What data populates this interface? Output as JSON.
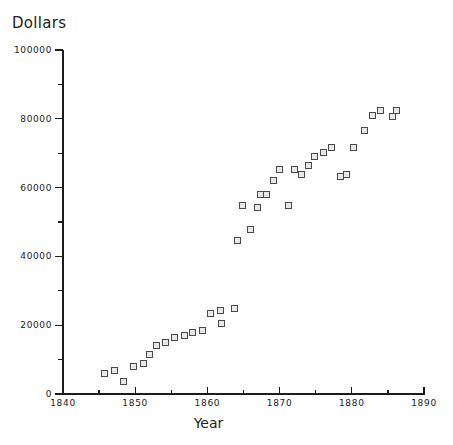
{
  "chart_data": {
    "type": "scatter",
    "title": "Dollars",
    "xlabel": "Year",
    "ylabel": "Dollars",
    "xlim": [
      1840,
      1890
    ],
    "ylim": [
      0,
      100000
    ],
    "grid": false,
    "legend": null,
    "marker": "open-square",
    "marker_color": "#4a4a4a",
    "x_major_ticks": [
      1840,
      1850,
      1860,
      1870,
      1880,
      1890
    ],
    "x_minor_ticks": [
      1845,
      1855,
      1865,
      1875,
      1885
    ],
    "y_major_ticks": [
      0,
      20000,
      40000,
      60000,
      80000,
      100000
    ],
    "y_minor_ticks": [
      10000,
      30000,
      50000,
      70000,
      90000
    ],
    "x_tick_labels": [
      "1840",
      "1850",
      "1860",
      "1870",
      "1880",
      "1890"
    ],
    "y_tick_labels": [
      "0",
      "20000",
      "40000",
      "60000",
      "80000",
      "100000"
    ],
    "points": [
      {
        "x": 1845.7,
        "y": 6100
      },
      {
        "x": 1847.2,
        "y": 6700
      },
      {
        "x": 1848.4,
        "y": 3500
      },
      {
        "x": 1849.8,
        "y": 8100
      },
      {
        "x": 1851.2,
        "y": 9000
      },
      {
        "x": 1852.0,
        "y": 11600
      },
      {
        "x": 1853.0,
        "y": 14200
      },
      {
        "x": 1854.2,
        "y": 15100
      },
      {
        "x": 1855.5,
        "y": 16300
      },
      {
        "x": 1856.8,
        "y": 16900
      },
      {
        "x": 1857.9,
        "y": 18000
      },
      {
        "x": 1859.3,
        "y": 18600
      },
      {
        "x": 1860.4,
        "y": 23500
      },
      {
        "x": 1861.8,
        "y": 24400
      },
      {
        "x": 1862.0,
        "y": 20600
      },
      {
        "x": 1863.8,
        "y": 25000
      },
      {
        "x": 1864.2,
        "y": 44700
      },
      {
        "x": 1864.9,
        "y": 54900
      },
      {
        "x": 1866.0,
        "y": 47800
      },
      {
        "x": 1866.9,
        "y": 54300
      },
      {
        "x": 1867.4,
        "y": 58100
      },
      {
        "x": 1868.2,
        "y": 57900
      },
      {
        "x": 1869.1,
        "y": 62100
      },
      {
        "x": 1870.0,
        "y": 65400
      },
      {
        "x": 1871.2,
        "y": 54900
      },
      {
        "x": 1872.0,
        "y": 65200
      },
      {
        "x": 1873.1,
        "y": 63700
      },
      {
        "x": 1874.0,
        "y": 66300
      },
      {
        "x": 1874.9,
        "y": 68900
      },
      {
        "x": 1876.1,
        "y": 70300
      },
      {
        "x": 1877.2,
        "y": 71800
      },
      {
        "x": 1878.5,
        "y": 63100
      },
      {
        "x": 1879.2,
        "y": 63700
      },
      {
        "x": 1880.3,
        "y": 71800
      },
      {
        "x": 1881.7,
        "y": 76700
      },
      {
        "x": 1882.9,
        "y": 81100
      },
      {
        "x": 1884.0,
        "y": 82300
      },
      {
        "x": 1885.6,
        "y": 80800
      },
      {
        "x": 1886.2,
        "y": 82300
      }
    ]
  }
}
